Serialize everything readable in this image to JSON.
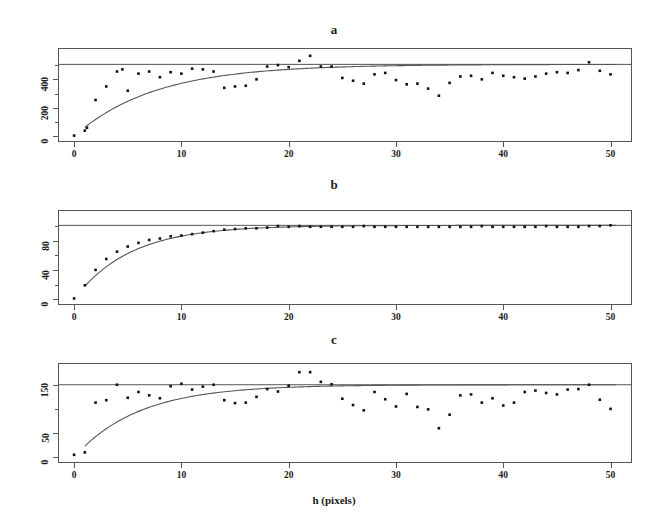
{
  "figure": {
    "background": "#ffffff",
    "point_color": "#111111",
    "line_color": "#555555",
    "frame_color": "#555555",
    "xlabel": "h (pixels)"
  },
  "chart_data": [
    {
      "type": "scatter",
      "title": "a",
      "panel_id": "a",
      "xlabel": "h (pixels)",
      "ylabel": "",
      "xlim": [
        -1.5,
        52
      ],
      "ylim": [
        -40,
        620
      ],
      "xticks": [
        0,
        10,
        20,
        30,
        40,
        50
      ],
      "xticklabels": [
        "0",
        "10",
        "20",
        "30",
        "40",
        "50"
      ],
      "yticks": [
        0,
        200,
        400
      ],
      "yticklabels": [
        "0",
        "200",
        "400"
      ],
      "yticks_minor": [
        100,
        300,
        500
      ],
      "grid": false,
      "legend": "none",
      "model": {
        "kind": "exponential-variogram",
        "nugget": 0,
        "sill": 505,
        "range": 7.5,
        "sill_line": 505,
        "curve_x_start": 1.0,
        "curve_x_end": 50.5
      },
      "x": [
        0,
        1,
        1.2,
        2,
        3,
        4,
        4.5,
        5,
        6,
        7,
        8,
        9,
        10,
        11,
        12,
        13,
        14,
        15,
        16,
        17,
        18,
        19,
        20,
        21,
        22,
        23,
        24,
        25,
        26,
        27,
        28,
        29,
        30,
        31,
        32,
        33,
        34,
        35,
        36,
        37,
        38,
        39,
        40,
        41,
        42,
        43,
        44,
        45,
        46,
        47,
        48,
        49,
        50
      ],
      "y": [
        5,
        40,
        60,
        255,
        350,
        455,
        470,
        320,
        440,
        455,
        415,
        450,
        440,
        475,
        470,
        455,
        340,
        350,
        355,
        400,
        490,
        500,
        485,
        530,
        565,
        490,
        490,
        410,
        390,
        370,
        435,
        445,
        395,
        365,
        370,
        335,
        285,
        375,
        420,
        425,
        400,
        445,
        425,
        415,
        405,
        420,
        440,
        450,
        445,
        465,
        520,
        460,
        435
      ]
    },
    {
      "type": "scatter",
      "title": "b",
      "panel_id": "b",
      "xlabel": "h (pixels)",
      "ylabel": "",
      "xlim": [
        -1.5,
        52
      ],
      "ylim": [
        -8,
        122
      ],
      "xticks": [
        0,
        10,
        20,
        30,
        40,
        50
      ],
      "xticklabels": [
        "0",
        "10",
        "20",
        "30",
        "40",
        "50"
      ],
      "yticks": [
        0,
        40,
        80
      ],
      "yticklabels": [
        "0",
        "40",
        "80"
      ],
      "yticks_minor": [
        20,
        60,
        100
      ],
      "grid": false,
      "legend": "none",
      "model": {
        "kind": "exponential-variogram",
        "nugget": 0,
        "sill": 101,
        "range": 5.2,
        "sill_line": 101,
        "curve_x_start": 1.0,
        "curve_x_end": 50.5
      },
      "x": [
        0,
        1,
        2,
        3,
        4,
        5,
        6,
        7,
        8,
        9,
        10,
        11,
        12,
        13,
        14,
        15,
        16,
        17,
        18,
        19,
        20,
        21,
        22,
        23,
        24,
        25,
        26,
        27,
        28,
        29,
        30,
        31,
        32,
        33,
        34,
        35,
        36,
        37,
        38,
        39,
        40,
        41,
        42,
        43,
        44,
        45,
        46,
        47,
        48,
        49,
        50
      ],
      "y": [
        1,
        19,
        40,
        55,
        65,
        72,
        77,
        81,
        83,
        86,
        87,
        89,
        91,
        93,
        95,
        96,
        97,
        97,
        98,
        100,
        99,
        100,
        99,
        99,
        99,
        99,
        99,
        100,
        99,
        99,
        99,
        99,
        99,
        99,
        99,
        99,
        99,
        99,
        100,
        99,
        99,
        99,
        99,
        99,
        100,
        99,
        99,
        99,
        100,
        100,
        101
      ]
    },
    {
      "type": "scatter",
      "title": "c",
      "panel_id": "c",
      "xlabel": "h (pixels)",
      "ylabel": "",
      "xlim": [
        -1.5,
        52
      ],
      "ylim": [
        -12,
        195
      ],
      "xticks": [
        0,
        10,
        20,
        30,
        40,
        50
      ],
      "xticklabels": [
        "0",
        "10",
        "20",
        "30",
        "40",
        "50"
      ],
      "yticks": [
        0,
        50,
        150
      ],
      "yticklabels": [
        "0",
        "50",
        "150"
      ],
      "yticks_minor": [
        100
      ],
      "grid": false,
      "legend": "none",
      "model": {
        "kind": "exponential-variogram",
        "nugget": 0,
        "sill": 150,
        "range": 6.0,
        "sill_line": 150,
        "curve_x_start": 1.0,
        "curve_x_end": 50.5
      },
      "x": [
        0,
        1,
        2,
        3,
        4,
        5,
        6,
        7,
        8,
        9,
        10,
        11,
        12,
        13,
        14,
        15,
        16,
        17,
        18,
        19,
        20,
        21,
        22,
        23,
        24,
        25,
        26,
        27,
        28,
        29,
        30,
        31,
        32,
        33,
        34,
        35,
        36,
        37,
        38,
        39,
        40,
        41,
        42,
        43,
        44,
        45,
        46,
        47,
        48,
        49,
        50
      ],
      "y": [
        5,
        10,
        113,
        118,
        150,
        123,
        135,
        128,
        122,
        147,
        152,
        140,
        146,
        150,
        118,
        112,
        113,
        125,
        141,
        136,
        148,
        176,
        176,
        156,
        151,
        121,
        108,
        97,
        135,
        120,
        105,
        131,
        104,
        99,
        60,
        88,
        128,
        130,
        113,
        122,
        107,
        113,
        135,
        138,
        133,
        130,
        140,
        141,
        150,
        119,
        100
      ]
    }
  ]
}
